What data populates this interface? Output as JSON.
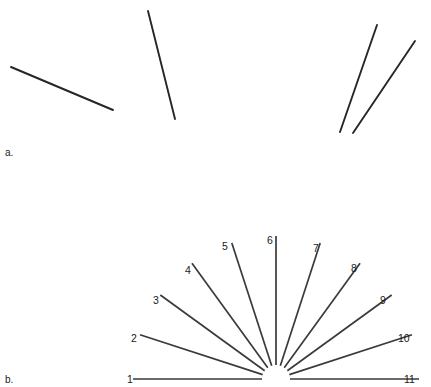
{
  "figure": {
    "width": 431,
    "height": 387,
    "background": "#ffffff",
    "line_color": "#262626",
    "fan_line_color": "#3a3a3a",
    "text_color": "#1a1a1a"
  },
  "panel_a": {
    "label": "a.",
    "label_x": 5,
    "label_y": 156,
    "lines": [
      {
        "name": "line-shallow-descending",
        "x1": 11,
        "y1": 67,
        "x2": 113,
        "y2": 110
      },
      {
        "name": "line-steep-descending",
        "x1": 148,
        "y1": 11,
        "x2": 175,
        "y2": 119
      },
      {
        "name": "line-steep-ascending-a",
        "x1": 377,
        "y1": 25,
        "x2": 340,
        "y2": 132
      },
      {
        "name": "line-steep-ascending-b",
        "x1": 415,
        "y1": 41,
        "x2": 353,
        "y2": 133
      }
    ]
  },
  "panel_b": {
    "label": "b.",
    "label_x": 5,
    "label_y": 383,
    "center_x": 276,
    "center_y": 379,
    "inner_radius": 14,
    "outer_radius": 143,
    "spokes": [
      {
        "label": "1",
        "angle_deg": 180,
        "label_x": 127,
        "label_y": 383,
        "anchor": "start"
      },
      {
        "label": "2",
        "angle_deg": 162,
        "label_x": 131,
        "label_y": 342,
        "anchor": "start"
      },
      {
        "label": "3",
        "angle_deg": 144,
        "label_x": 153,
        "label_y": 304,
        "anchor": "start"
      },
      {
        "label": "4",
        "angle_deg": 126,
        "label_x": 185,
        "label_y": 274,
        "anchor": "start"
      },
      {
        "label": "5",
        "angle_deg": 108,
        "label_x": 222,
        "label_y": 250,
        "anchor": "start"
      },
      {
        "label": "6",
        "angle_deg": 90,
        "label_x": 267,
        "label_y": 244,
        "anchor": "start"
      },
      {
        "label": "7",
        "angle_deg": 72,
        "label_x": 313,
        "label_y": 252,
        "anchor": "start"
      },
      {
        "label": "8",
        "angle_deg": 54,
        "label_x": 351,
        "label_y": 272,
        "anchor": "start"
      },
      {
        "label": "9",
        "angle_deg": 36,
        "label_x": 380,
        "label_y": 304,
        "anchor": "start"
      },
      {
        "label": "10",
        "angle_deg": 18,
        "label_x": 398,
        "label_y": 342,
        "anchor": "start"
      },
      {
        "label": "11",
        "angle_deg": 0,
        "label_x": 404,
        "label_y": 383,
        "anchor": "start"
      }
    ]
  }
}
